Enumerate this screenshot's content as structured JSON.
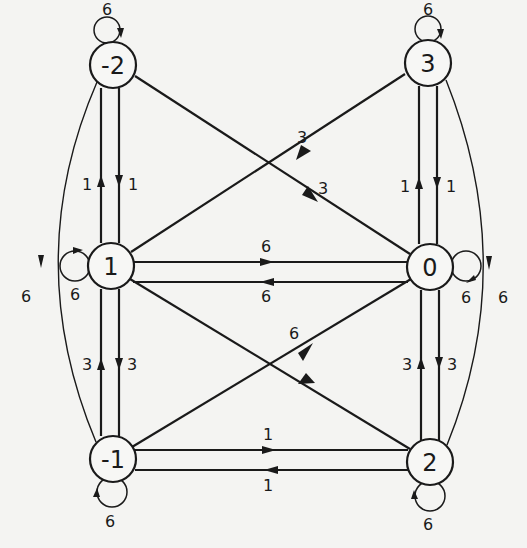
{
  "diagram": {
    "type": "directed-weighted-graph",
    "nodes": [
      {
        "id": "n-2",
        "label": "-2",
        "x": 113,
        "y": 65
      },
      {
        "id": "n3",
        "label": "3",
        "x": 428,
        "y": 63
      },
      {
        "id": "n1",
        "label": "1",
        "x": 111,
        "y": 266
      },
      {
        "id": "n0",
        "label": "0",
        "x": 430,
        "y": 267
      },
      {
        "id": "n-1",
        "label": "-1",
        "x": 113,
        "y": 459
      },
      {
        "id": "n2",
        "label": "2",
        "x": 430,
        "y": 462
      }
    ],
    "edges": [
      {
        "from": "-2",
        "to": "-2",
        "weight": "6",
        "kind": "self-loop"
      },
      {
        "from": "3",
        "to": "3",
        "weight": "6",
        "kind": "self-loop"
      },
      {
        "from": "1",
        "to": "1",
        "weight": "6",
        "kind": "self-loop"
      },
      {
        "from": "0",
        "to": "0",
        "weight": "6",
        "kind": "self-loop"
      },
      {
        "from": "-1",
        "to": "-1",
        "weight": "6",
        "kind": "self-loop"
      },
      {
        "from": "2",
        "to": "2",
        "weight": "6",
        "kind": "self-loop"
      },
      {
        "from": "1",
        "to": "-2",
        "weight": "1"
      },
      {
        "from": "-2",
        "to": "1",
        "weight": "1"
      },
      {
        "from": "0",
        "to": "3",
        "weight": "1"
      },
      {
        "from": "3",
        "to": "0",
        "weight": "1"
      },
      {
        "from": "1",
        "to": "0",
        "weight": "6"
      },
      {
        "from": "0",
        "to": "1",
        "weight": "6"
      },
      {
        "from": "-1",
        "to": "1",
        "weight": "3"
      },
      {
        "from": "1",
        "to": "-1",
        "weight": "3"
      },
      {
        "from": "2",
        "to": "0",
        "weight": "3"
      },
      {
        "from": "0",
        "to": "2",
        "weight": "3"
      },
      {
        "from": "-1",
        "to": "2",
        "weight": "1"
      },
      {
        "from": "2",
        "to": "-1",
        "weight": "1"
      },
      {
        "from": "3",
        "to": "1",
        "weight": "3"
      },
      {
        "from": "-2",
        "to": "0",
        "weight": "3"
      },
      {
        "from": "-1",
        "to": "0",
        "weight": "6"
      },
      {
        "from": "2",
        "to": "1",
        "weight": ""
      },
      {
        "from": "-2",
        "to": "-1",
        "weight": "6",
        "kind": "outer-arc"
      },
      {
        "from": "3",
        "to": "2",
        "weight": "6",
        "kind": "outer-arc"
      }
    ],
    "weight_labels": {
      "loop_m2": "6",
      "loop_3": "6",
      "loop_1": "6",
      "loop_0": "6",
      "loop_m1": "6",
      "loop_2": "6",
      "e_1_m2": "1",
      "e_m2_1": "1",
      "e_0_3": "1",
      "e_3_0": "1",
      "e_1_0": "6",
      "e_0_1": "6",
      "e_m1_1": "3",
      "e_1_m1": "3",
      "e_2_0": "3",
      "e_0_2": "3",
      "e_m1_2": "1",
      "e_2_m1": "1",
      "e_3_1": "3",
      "e_m2_0": "3",
      "e_m1_0": "6",
      "arc_m2_m1": "6",
      "arc_3_2": "6"
    }
  }
}
